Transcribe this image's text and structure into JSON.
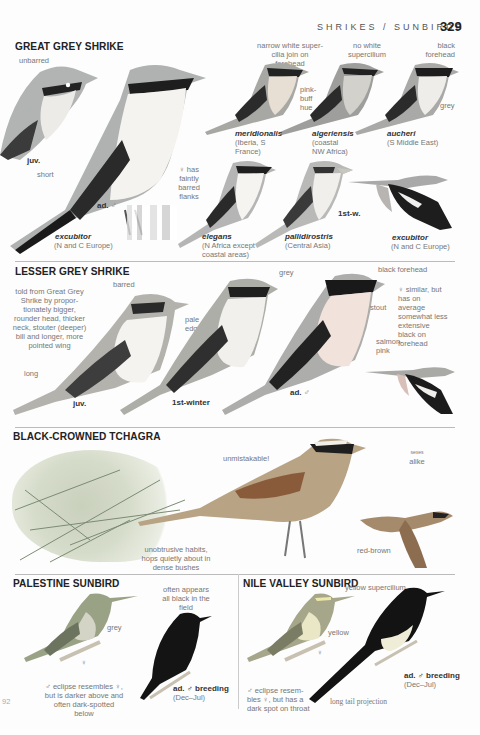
{
  "header": {
    "running_head": "SHRIKES / SUNBIRDS",
    "page_number": "329"
  },
  "great_grey_shrike": {
    "title": "GREAT GREY SHRIKE",
    "notes": {
      "unbarred": "unbarred",
      "juv": "juv.",
      "short": "short",
      "ad_male": "ad.",
      "male_symbol": "♂",
      "female_flanks": "♀ has faintly barred flanks",
      "narrow_supercilium": "narrow white super-cilia join on forehead",
      "no_supercilium": "no white supercilium",
      "black_forehead": "black forehead",
      "pink_buff": "pink-buff hue",
      "grey": "grey",
      "first_winter": "1st-w."
    },
    "races": [
      {
        "name": "excubitor",
        "range": "(N and C Europe)"
      },
      {
        "name": "meridionalis",
        "range": "(Iberia, S France)"
      },
      {
        "name": "algeriensis",
        "range": "(coastal NW Africa)"
      },
      {
        "name": "aucheri",
        "range": "(S Middle East)"
      },
      {
        "name": "elegans",
        "range": "(N Africa except coastal areas)"
      },
      {
        "name": "pallidirostris",
        "range": "(Central Asia)"
      },
      {
        "name": "excubitor",
        "range": "(N and C Europe)"
      }
    ]
  },
  "lesser_grey_shrike": {
    "title": "LESSER GREY SHRIKE",
    "notes": {
      "told_from": "told from Great Grey Shrike by propor-tionately bigger, rounder head, thicker neck, stouter (deeper) bill and longer, more pointed wing",
      "barred": "barred",
      "long": "long",
      "juv": "juv.",
      "pale_edges": "pale edges",
      "first_winter": "1st-winter",
      "grey": "grey",
      "black_forehead": "black forehead",
      "stout": "stout",
      "female_similar": "♀ similar, but has on average somewhat less extensive black on forehead",
      "salmon_pink": "salmon-pink",
      "ad_male": "ad.",
      "male_symbol": "♂"
    }
  },
  "black_crowned_tchagra": {
    "title": "BLACK-CROWNED TCHAGRA",
    "notes": {
      "unmistakable": "unmistakable!",
      "sexes_alike_top": "sexes",
      "sexes_alike": "alike",
      "unobtrusive": "unobtrusive habits, hops quietly about in dense bushes",
      "red_brown": "red-brown"
    }
  },
  "palestine_sunbird": {
    "title": "PALESTINE SUNBIRD",
    "notes": {
      "often_black": "often appears all black in the field",
      "grey": "grey",
      "female_symbol": "♀",
      "eclipse": "♂ eclipse resembles ♀, but is darker above and often dark-spotted below",
      "ad_breeding": "ad. ♂ breeding",
      "breeding_months": "(Dec–Jul)",
      "margin_ref": "92"
    }
  },
  "nile_valley_sunbird": {
    "title": "NILE VALLEY SUNBIRD",
    "notes": {
      "yellow_supercilium": "yellow supercilium",
      "yellow": "yellow",
      "female_symbol": "♀",
      "eclipse": "♂ eclipse resem-bles ♀, but has a dark spot on throat",
      "long_tail": "long tail projection",
      "ad_breeding": "ad. ♂ breeding",
      "breeding_months": "(Dec–Jul)"
    }
  },
  "colors": {
    "shrike_grey": "#a9acad",
    "mask_black": "#1e1e1e",
    "breast_white": "#f2f0ec",
    "salmon": "#efd9cf",
    "tchagra_brown": "#b39b7e",
    "tchagra_wing": "#8d5d3c",
    "sunbird_olive": "#8f9a7f",
    "sunbird_black": "#141414",
    "bush_green": "#b7c1a6"
  }
}
